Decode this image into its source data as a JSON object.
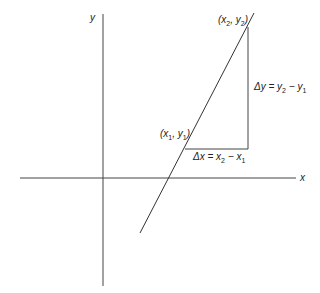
{
  "diagram": {
    "axes": {
      "x_label": "x",
      "y_label": "y"
    },
    "points": {
      "p1": {
        "label": "(x1, y1)",
        "var_x": "x",
        "sub_x": "1",
        "var_y": "y",
        "sub_y": "1"
      },
      "p2": {
        "label": "(x2, y2)",
        "var_x": "x",
        "sub_x": "2",
        "var_y": "y",
        "sub_y": "2"
      }
    },
    "delta_y": {
      "text": "Δy = y2 − y1",
      "lhs": "Δy = y",
      "s1": "2",
      "mid": " − y",
      "s2": "1"
    },
    "delta_x": {
      "text": "Δx = x2 − x1",
      "lhs": "Δx = x",
      "s1": "2",
      "mid": " − x",
      "s2": "1"
    },
    "colors": {
      "line": "#333333",
      "axis": "#444444",
      "background": "#ffffff"
    }
  }
}
